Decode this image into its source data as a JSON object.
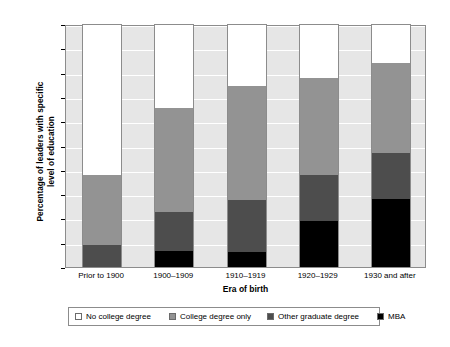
{
  "chart_data": {
    "type": "bar",
    "subtype": "stacked-bar-100",
    "title": "",
    "xlabel": "Era of birth",
    "ylabel": "Percentage of leaders with specific level of education",
    "ylabel_lines": [
      "Percentage of leaders with specific",
      "level of education"
    ],
    "categories": [
      "Prior to 1900",
      "1900–1909",
      "1910–1919",
      "1920–1929",
      "1930 and after"
    ],
    "ylim": [
      0,
      100
    ],
    "yticks": [
      0,
      10,
      20,
      30,
      40,
      50,
      60,
      70,
      80,
      90,
      100
    ],
    "ytick_labels": [
      "0",
      "10",
      "20",
      "30",
      "40",
      "50",
      "60",
      "70",
      "80",
      "90",
      "100"
    ],
    "grid": true,
    "legend_position": "bottom",
    "series": [
      {
        "name": "No college degree",
        "color": "#ffffff",
        "values": [
          62.0,
          34.5,
          25.0,
          22.0,
          15.5
        ]
      },
      {
        "name": "College degree only",
        "color": "#939393",
        "values": [
          29.0,
          43.0,
          47.5,
          40.0,
          37.5
        ]
      },
      {
        "name": "Other graduate degree",
        "color": "#4d4d4d",
        "values": [
          9.0,
          16.5,
          21.5,
          19.0,
          19.0
        ]
      },
      {
        "name": "MBA",
        "color": "#000000",
        "values": [
          0.0,
          6.5,
          6.0,
          19.0,
          28.0
        ]
      }
    ],
    "cumulative_tops": {
      "mba": [
        0.0,
        6.5,
        6.0,
        19.0,
        28.0
      ],
      "other": [
        9.0,
        23.0,
        27.5,
        38.0,
        47.0
      ],
      "college": [
        38.0,
        66.0,
        75.0,
        78.0,
        84.5
      ],
      "none": [
        100,
        100,
        100,
        100,
        100
      ]
    },
    "legend": [
      {
        "label": "No college degree",
        "swatch": "white"
      },
      {
        "label": "College degree only",
        "swatch": "gray"
      },
      {
        "label": "Other graduate degree",
        "swatch": "dark-gray"
      },
      {
        "label": "MBA",
        "swatch": "black"
      }
    ]
  }
}
